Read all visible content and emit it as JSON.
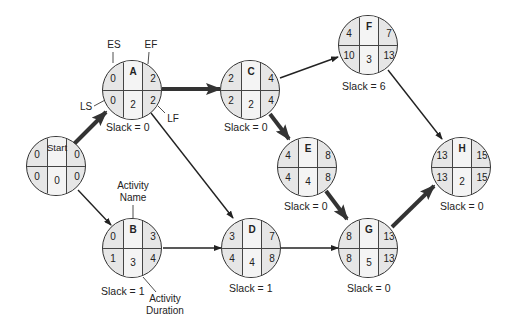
{
  "diagram": {
    "type": "activity-on-node network (critical path)",
    "legend": {
      "es": "ES",
      "ef": "EF",
      "ls": "LS",
      "lf": "LF",
      "activity_name": "Activity Name",
      "activity_name_l1": "Activity",
      "activity_name_l2": "Name",
      "activity_duration_l1": "Activity",
      "activity_duration_l2": "Duration"
    },
    "nodes": [
      {
        "id": "Start",
        "label": "Start",
        "es": "0",
        "ef": "0",
        "ls": "0",
        "lf": "0",
        "duration": "0",
        "slack": ""
      },
      {
        "id": "A",
        "label": "A",
        "es": "0",
        "ef": "2",
        "ls": "0",
        "lf": "2",
        "duration": "2",
        "slack": "Slack = 0"
      },
      {
        "id": "B",
        "label": "B",
        "es": "0",
        "ef": "3",
        "ls": "1",
        "lf": "4",
        "duration": "3",
        "slack": "Slack = 1"
      },
      {
        "id": "C",
        "label": "C",
        "es": "2",
        "ef": "4",
        "ls": "2",
        "lf": "4",
        "duration": "2",
        "slack": "Slack = 0"
      },
      {
        "id": "D",
        "label": "D",
        "es": "3",
        "ef": "7",
        "ls": "4",
        "lf": "8",
        "duration": "4",
        "slack": "Slack = 1"
      },
      {
        "id": "E",
        "label": "E",
        "es": "4",
        "ef": "8",
        "ls": "4",
        "lf": "8",
        "duration": "4",
        "slack": "Slack = 0"
      },
      {
        "id": "F",
        "label": "F",
        "es": "4",
        "ef": "7",
        "ls": "10",
        "lf": "13",
        "duration": "3",
        "slack": "Slack = 6"
      },
      {
        "id": "G",
        "label": "G",
        "es": "8",
        "ef": "13",
        "ls": "8",
        "lf": "13",
        "duration": "5",
        "slack": "Slack = 0"
      },
      {
        "id": "H",
        "label": "H",
        "es": "13",
        "ef": "15",
        "ls": "13",
        "lf": "15",
        "duration": "2",
        "slack": "Slack = 0"
      }
    ],
    "edges": [
      {
        "from": "Start",
        "to": "A",
        "critical": true
      },
      {
        "from": "Start",
        "to": "B",
        "critical": false
      },
      {
        "from": "A",
        "to": "C",
        "critical": true
      },
      {
        "from": "A",
        "to": "D",
        "critical": false
      },
      {
        "from": "B",
        "to": "D",
        "critical": false
      },
      {
        "from": "C",
        "to": "E",
        "critical": true
      },
      {
        "from": "C",
        "to": "F",
        "critical": false
      },
      {
        "from": "D",
        "to": "G",
        "critical": false
      },
      {
        "from": "E",
        "to": "G",
        "critical": true
      },
      {
        "from": "F",
        "to": "H",
        "critical": false
      },
      {
        "from": "G",
        "to": "H",
        "critical": true
      }
    ],
    "colors": {
      "node_side": "#e6e6e6",
      "node_center": "#f4f4f4",
      "line": "#333333",
      "background": "#ffffff"
    }
  }
}
